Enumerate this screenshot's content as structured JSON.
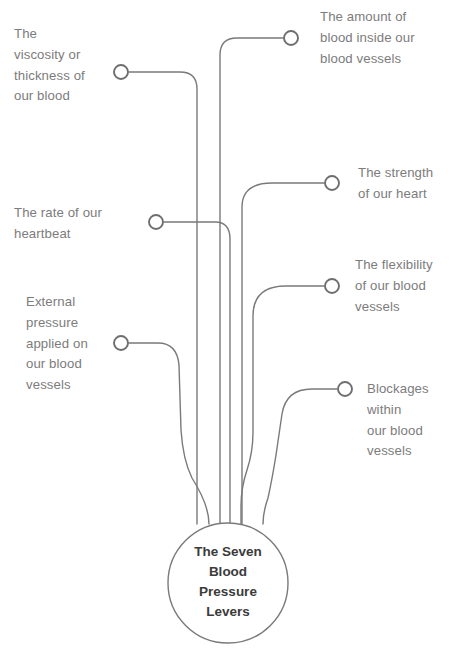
{
  "diagram": {
    "type": "radial-hub-and-spoke",
    "hub": {
      "title": "The Seven\nBlood\nPressure\nLevers",
      "cx": 228,
      "cy": 583,
      "r": 60
    },
    "colors": {
      "background": "#ffffff",
      "line": "#7a7a7a",
      "label_text": "#7c7c7c",
      "hub_text": "#3b3b3b",
      "node_fill": "#ffffff",
      "node_stroke": "#6e6e6e"
    },
    "nodes": [
      {
        "id": "viscosity",
        "label": "The\nviscosity or\nthickness of\nour blood",
        "side": "left",
        "node_cx": 121,
        "node_cy": 72,
        "label_x": 14,
        "label_y": 24,
        "trunk_x": 197
      },
      {
        "id": "blood-amount",
        "label": "The amount of\nblood inside our\nblood vessels",
        "side": "right",
        "node_cx": 291,
        "node_cy": 38,
        "label_x": 320,
        "label_y": 7,
        "trunk_x": 220
      },
      {
        "id": "heart-strength",
        "label": "The strength\nof our heart",
        "side": "right",
        "node_cx": 332,
        "node_cy": 183,
        "label_x": 358,
        "label_y": 163,
        "trunk_x": 242
      },
      {
        "id": "heart-rate",
        "label": "The rate of our\nheartbeat",
        "side": "left",
        "node_cx": 156,
        "node_cy": 222,
        "label_x": 14,
        "label_y": 203,
        "trunk_x": 230
      },
      {
        "id": "vessel-flexibility",
        "label": "The flexibility\nof our blood\nvessels",
        "side": "right",
        "node_cx": 332,
        "node_cy": 286,
        "label_x": 355,
        "label_y": 255,
        "trunk_x": 253
      },
      {
        "id": "external-pressure",
        "label": "External\npressure\napplied on\nour blood\nvessels",
        "side": "left",
        "node_cx": 121,
        "node_cy": 343,
        "label_x": 26,
        "label_y": 292,
        "trunk_x": 209
      },
      {
        "id": "blockages",
        "label": "Blockages\nwithin\nour blood\nvessels",
        "side": "right",
        "node_cx": 345,
        "node_cy": 389,
        "label_x": 367,
        "label_y": 379,
        "trunk_x": 263
      }
    ],
    "paths": {
      "viscosity": "M 129 72 L 180 72 Q 197 72 197 89 L 197 524",
      "blood-amount": "M 283 38 L 237 38 Q 220 38 220 55 L 220 524",
      "heart-strength": "M 324 183 L 272 183 Q 242 183 242 207 L 242 524",
      "heart-rate": "M 164 222 L 215 222 Q 230 222 230 239 L 230 524",
      "vessel-flexibility": "M 324 286 L 286 286 Q 253 286 253 316 L 253 432 Q 253 452 247 470 Q 241 488 241 506 L 241 524",
      "external-pressure": "M 129 343 L 158 343 Q 177 343 179 365 L 181 430 Q 183 460 192 478 Q 209 505 209 524",
      "blockages": "M 337 389 L 312 389 Q 286 389 282 414 L 276 455 Q 272 480 268 498 Q 263 512 263 524"
    }
  }
}
